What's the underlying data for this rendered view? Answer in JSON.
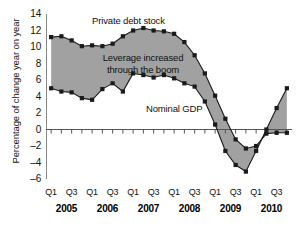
{
  "chart_data": {
    "type": "line",
    "title": "",
    "xlabel": "",
    "ylabel": "Percentage of change year on year",
    "ylim": [
      -6,
      14
    ],
    "ytick_values": [
      14,
      12,
      10,
      8,
      6,
      4,
      2,
      0,
      -2,
      -4,
      -6
    ],
    "ytick_labels": [
      "14",
      "12",
      "10",
      "8",
      "6",
      "4",
      "2",
      "0",
      "-2",
      "-4",
      "-6"
    ],
    "grid": false,
    "legend_position": "inline-annotations",
    "x": [
      "2005 Q1",
      "2005 Q2",
      "2005 Q3",
      "2005 Q4",
      "2006 Q1",
      "2006 Q2",
      "2006 Q3",
      "2006 Q4",
      "2007 Q1",
      "2007 Q2",
      "2007 Q3",
      "2007 Q4",
      "2008 Q1",
      "2008 Q2",
      "2008 Q3",
      "2008 Q4",
      "2009 Q1",
      "2009 Q2",
      "2009 Q3",
      "2009 Q4",
      "2010 Q1",
      "2010 Q2",
      "2010 Q3",
      "2010 Q4"
    ],
    "quarter_labels": [
      "Q1",
      "Q3",
      "Q1",
      "Q3",
      "Q1",
      "Q3",
      "Q1",
      "Q3",
      "Q1",
      "Q3",
      "Q1",
      "Q3"
    ],
    "year_labels": [
      "2005",
      "2006",
      "2007",
      "2008",
      "2009",
      "2010"
    ],
    "series": [
      {
        "name": "Private debt stock",
        "values": [
          11.2,
          11.3,
          10.8,
          10.1,
          10.2,
          10.1,
          10.4,
          11.3,
          12.0,
          12.3,
          12.0,
          11.9,
          11.6,
          10.6,
          9.0,
          6.8,
          4.1,
          1.3,
          -1.2,
          -2.3,
          -2.0,
          -0.5,
          -0.4,
          -0.4
        ]
      },
      {
        "name": "Nominal GDP",
        "values": [
          5.0,
          4.6,
          4.5,
          3.8,
          3.6,
          4.9,
          5.6,
          4.6,
          6.8,
          6.6,
          6.3,
          6.6,
          6.2,
          5.6,
          5.2,
          3.4,
          0.6,
          -2.6,
          -4.3,
          -5.1,
          -2.6,
          0.0,
          2.6,
          5.0
        ]
      }
    ],
    "shaded_band": {
      "label": "Leverage increased through the boom",
      "between": [
        "Private debt stock",
        "Nominal GDP"
      ],
      "color": "#8c8c8c"
    },
    "annotations": [
      {
        "text": "Private debt stock",
        "x": "2006 Q3"
      },
      {
        "text": "Leverage increased through the boom",
        "x": "2006 Q2"
      },
      {
        "text": "Nominal GDP",
        "x": "2008 Q1"
      }
    ],
    "colors": {
      "line": "#1a1a1a",
      "marker": "#1a1a1a",
      "fill": "#8c8c8c",
      "axis": "#555555",
      "background": "#ffffff"
    }
  }
}
